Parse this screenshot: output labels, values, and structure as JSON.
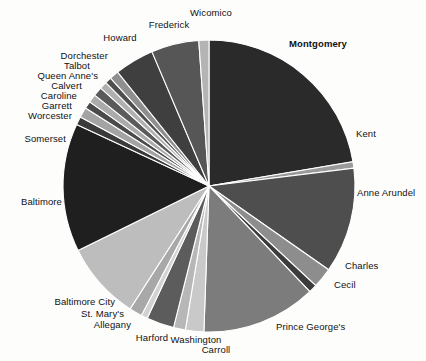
{
  "chart_data": {
    "type": "pie",
    "title": "",
    "subtitle": "",
    "xlabel": "",
    "ylabel": "",
    "legend_position": "none",
    "grid": false,
    "units": "share of total",
    "start_angle_deg": 0,
    "direction": "clockwise",
    "categories": [
      "Montgomery",
      "Kent",
      "Anne Arundel",
      "Charles",
      "Cecil",
      "Prince George's",
      "Carroll",
      "Washington",
      "Harford",
      "Allegany",
      "St. Mary's",
      "Baltimore City",
      "Baltimore",
      "Somerset",
      "Worcester",
      "Garrett",
      "Caroline",
      "Calvert",
      "Queen Anne's",
      "Talbot",
      "Dorchester",
      "Howard",
      "Frederick",
      "Wicomico"
    ],
    "values": [
      22.0,
      0.7,
      11.5,
      2.2,
      0.9,
      12.5,
      2.0,
      1.3,
      3.0,
      0.7,
      1.4,
      8.5,
      14.0,
      0.9,
      1.1,
      0.8,
      0.9,
      1.0,
      0.8,
      0.7,
      1.0,
      4.3,
      5.2,
      1.1
    ],
    "colors": [
      "#2a2a2a",
      "#9a9a9a",
      "#4e4e4e",
      "#8d8d8d",
      "#3c3c3c",
      "#7c7c7c",
      "#c9c9c9",
      "#b7b7b7",
      "#5c5c5c",
      "#d2d2d2",
      "#a8a8a8",
      "#bdbdbd",
      "#1f1f1f",
      "#3a3a3a",
      "#a3a3a3",
      "#4a4a4a",
      "#ababab",
      "#5a5a5a",
      "#b0b0b0",
      "#4f4f4f",
      "#8f8f8f",
      "#3f3f3f",
      "#565656",
      "#b4b4b4"
    ],
    "labels": [
      {
        "name": "Montgomery",
        "bold": true,
        "align": "left",
        "x": 289,
        "y": 44
      },
      {
        "name": "Kent",
        "bold": false,
        "align": "left",
        "x": 356,
        "y": 134
      },
      {
        "name": "Anne Arundel",
        "bold": false,
        "align": "left",
        "x": 357,
        "y": 193
      },
      {
        "name": "Charles",
        "bold": false,
        "align": "left",
        "x": 345,
        "y": 266
      },
      {
        "name": "Cecil",
        "bold": false,
        "align": "left",
        "x": 334,
        "y": 285
      },
      {
        "name": "Prince George's",
        "bold": false,
        "align": "left",
        "x": 276,
        "y": 327
      },
      {
        "name": "Carroll",
        "bold": false,
        "align": "center",
        "x": 216,
        "y": 350
      },
      {
        "name": "Washington",
        "bold": false,
        "align": "center",
        "x": 196,
        "y": 340
      },
      {
        "name": "Harford",
        "bold": false,
        "align": "center",
        "x": 152,
        "y": 338
      },
      {
        "name": "Allegany",
        "bold": false,
        "align": "right",
        "x": 131,
        "y": 325
      },
      {
        "name": "St. Mary's",
        "bold": false,
        "align": "right",
        "x": 124,
        "y": 314
      },
      {
        "name": "Baltimore City",
        "bold": false,
        "align": "right",
        "x": 115,
        "y": 302
      },
      {
        "name": "Baltimore",
        "bold": false,
        "align": "right",
        "x": 62,
        "y": 202
      },
      {
        "name": "Somerset",
        "bold": false,
        "align": "right",
        "x": 66,
        "y": 139
      },
      {
        "name": "Worcester",
        "bold": false,
        "align": "right",
        "x": 72,
        "y": 116
      },
      {
        "name": "Garrett",
        "bold": false,
        "align": "right",
        "x": 72,
        "y": 106
      },
      {
        "name": "Caroline",
        "bold": false,
        "align": "right",
        "x": 77,
        "y": 96
      },
      {
        "name": "Calvert",
        "bold": false,
        "align": "right",
        "x": 82,
        "y": 86
      },
      {
        "name": "Queen Anne's",
        "bold": false,
        "align": "right",
        "x": 98,
        "y": 76
      },
      {
        "name": "Talbot",
        "bold": false,
        "align": "right",
        "x": 90,
        "y": 66
      },
      {
        "name": "Dorchester",
        "bold": false,
        "align": "right",
        "x": 108,
        "y": 56
      },
      {
        "name": "Howard",
        "bold": false,
        "align": "center",
        "x": 120,
        "y": 38
      },
      {
        "name": "Frederick",
        "bold": false,
        "align": "center",
        "x": 169,
        "y": 25
      },
      {
        "name": "Wicomico",
        "bold": false,
        "align": "center",
        "x": 211,
        "y": 13
      }
    ],
    "geometry": {
      "cx": 209,
      "cy": 186,
      "r": 146
    }
  }
}
